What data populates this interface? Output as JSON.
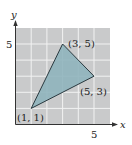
{
  "figure": {
    "axes": {
      "x_label": "x",
      "y_label": "y",
      "x_tick_label": "5",
      "y_tick_label": "5",
      "range": [
        0,
        6
      ]
    },
    "colors": {
      "grid_background": "#c9cacb",
      "grid_lines": "#f2f2f2",
      "triangle_fill": "#8fb4bd",
      "triangle_stroke": "#2b3a40",
      "axis": "#333333"
    },
    "triangle": {
      "vertices": [
        {
          "label": "(1, 1)",
          "x": 1,
          "y": 1
        },
        {
          "label": "(3, 5)",
          "x": 3,
          "y": 5
        },
        {
          "label": "(5, 3)",
          "x": 5,
          "y": 3
        }
      ]
    }
  }
}
